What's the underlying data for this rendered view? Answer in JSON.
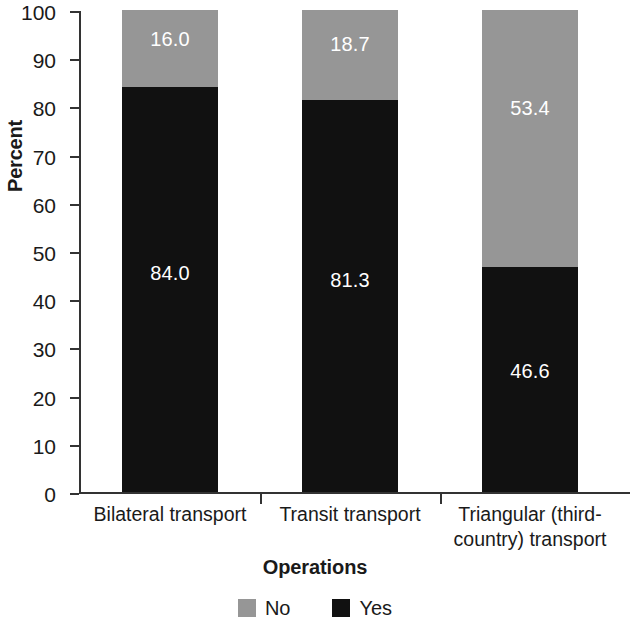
{
  "chart_data": {
    "type": "bar",
    "subtype": "stacked-100-percent",
    "title": "",
    "xlabel": "Operations",
    "ylabel": "Percent",
    "ylim": [
      0,
      100
    ],
    "ytick_step": 10,
    "yticks": [
      100,
      90,
      80,
      70,
      60,
      50,
      40,
      30,
      20,
      10,
      0
    ],
    "ytick_labels": [
      "100",
      "90",
      "80",
      "70",
      "60",
      "50",
      "40",
      "30",
      "20",
      "10",
      "0"
    ],
    "grid": false,
    "legend_position": "bottom",
    "categories": [
      "Bilateral transport",
      "Transit transport",
      "Triangular (third-country) transport"
    ],
    "category_label_lines": [
      [
        "Bilateral transport"
      ],
      [
        "Transit transport"
      ],
      [
        "Triangular (third-",
        "country) transport"
      ]
    ],
    "series": [
      {
        "name": "No",
        "color": "#969696",
        "values": [
          16.0,
          18.7,
          53.4
        ],
        "labels": [
          "16.0",
          "18.7",
          "53.4"
        ]
      },
      {
        "name": "Yes",
        "color": "#111111",
        "values": [
          84.0,
          81.3,
          46.6
        ],
        "labels": [
          "84.0",
          "81.3",
          "46.6"
        ]
      }
    ]
  },
  "legend": {
    "items": [
      {
        "label": "No",
        "color": "#969696",
        "swatch_name": "legend-swatch-no"
      },
      {
        "label": "Yes",
        "color": "#111111",
        "swatch_name": "legend-swatch-yes"
      }
    ]
  },
  "colors": {
    "no": "#969696",
    "yes": "#111111",
    "axis": "#333333",
    "text": "#1a1a1a",
    "label_text": "#ffffff",
    "background": "#ffffff"
  }
}
